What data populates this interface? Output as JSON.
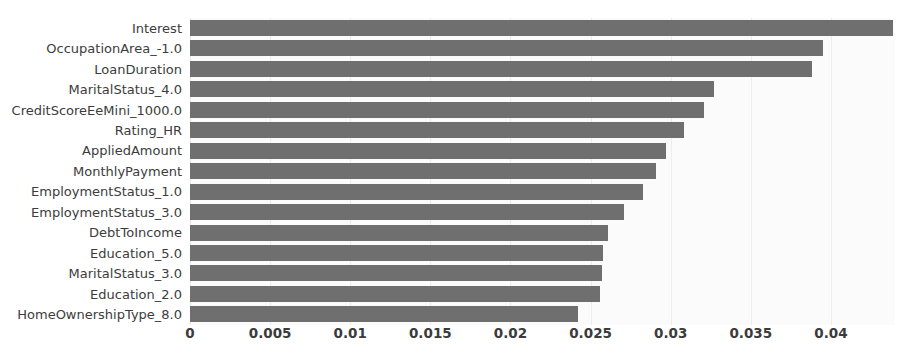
{
  "chart_data": {
    "type": "bar",
    "orientation": "horizontal",
    "title": "",
    "xlabel": "",
    "ylabel": "",
    "xlim": [
      0,
      0.044
    ],
    "ylim": [
      0,
      15
    ],
    "grid": true,
    "legend": null,
    "bar_color": "#6f6f6f",
    "plot_background": "#fbfbfb",
    "figure_background": "#ffffff",
    "xticks": [
      "0",
      "0.005",
      "0.01",
      "0.015",
      "0.02",
      "0.025",
      "0.03",
      "0.035",
      "0.04"
    ],
    "xtick_values": [
      0,
      0.005,
      0.01,
      0.015,
      0.02,
      0.025,
      0.03,
      0.035,
      0.04
    ],
    "categories": [
      "Interest",
      "OccupationArea_-1.0",
      "LoanDuration",
      "MaritalStatus_4.0",
      "CreditScoreEeMini_1000.0",
      "Rating_HR",
      "AppliedAmount",
      "MonthlyPayment",
      "EmploymentStatus_1.0",
      "EmploymentStatus_3.0",
      "DebtToIncome",
      "Education_5.0",
      "MaritalStatus_3.0",
      "Education_2.0",
      "HomeOwnershipType_8.0"
    ],
    "values": [
      0.0439,
      0.0395,
      0.0388,
      0.0327,
      0.0321,
      0.0308,
      0.0297,
      0.0291,
      0.0283,
      0.0271,
      0.0261,
      0.0258,
      0.0257,
      0.0256,
      0.0242
    ]
  }
}
